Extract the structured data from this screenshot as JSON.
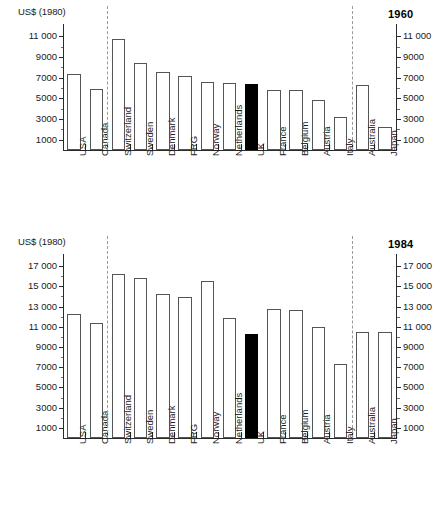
{
  "figure": {
    "axis_unit_label": "US$ (1980)",
    "bar_edge_color": "#555555",
    "highlight_color": "#000000",
    "divider_color": "#9a9a9a",
    "highlight_category": "UK"
  },
  "chart_data": [
    {
      "type": "bar",
      "title": "1960",
      "xlabel": "",
      "ylabel": "US$ (1980)",
      "ylim": [
        0,
        11800
      ],
      "grid": false,
      "legend": "none",
      "ytick_labels": [
        "1000",
        "3000",
        "5000",
        "7000",
        "9000",
        "11 000"
      ],
      "ytick_values": [
        1000,
        3000,
        5000,
        7000,
        9000,
        11000
      ],
      "y_axis_duplicated_right": true,
      "categories": [
        "USA",
        "Canada",
        "Switzerland",
        "Sweden",
        "Denmark",
        "FRG",
        "Norway",
        "Netherlands",
        "UK",
        "France",
        "Belgium",
        "Austria",
        "Italy",
        "Australia",
        "Japan"
      ],
      "values": [
        7350,
        5900,
        10750,
        8450,
        7500,
        7200,
        6600,
        6500,
        6350,
        5800,
        5800,
        4850,
        3200,
        6250,
        2200
      ],
      "highlighted": [
        "UK"
      ],
      "group_dividers_after": [
        "Canada",
        "Italy"
      ]
    },
    {
      "type": "bar",
      "title": "1984",
      "xlabel": "",
      "ylabel": "US$ (1980)",
      "ylim": [
        0,
        17800
      ],
      "grid": false,
      "legend": "none",
      "ytick_labels": [
        "1000",
        "3000",
        "5000",
        "7000",
        "9000",
        "11 000",
        "13 000",
        "15 000",
        "17 000"
      ],
      "ytick_values": [
        1000,
        3000,
        5000,
        7000,
        9000,
        11000,
        13000,
        15000,
        17000
      ],
      "y_axis_duplicated_right": true,
      "categories": [
        "USA",
        "Canada",
        "Switzerland",
        "Sweden",
        "Denmark",
        "FRG",
        "Norway",
        "Netherlands",
        "UK",
        "France",
        "Belgium",
        "Austria",
        "Italy",
        "Australia",
        "Japan"
      ],
      "values": [
        12300,
        11400,
        16200,
        15800,
        14200,
        13900,
        15500,
        11850,
        10300,
        12750,
        12700,
        11000,
        7350,
        10450,
        10450
      ],
      "highlighted": [
        "UK"
      ],
      "group_dividers_after": [
        "Canada",
        "Italy"
      ]
    }
  ]
}
